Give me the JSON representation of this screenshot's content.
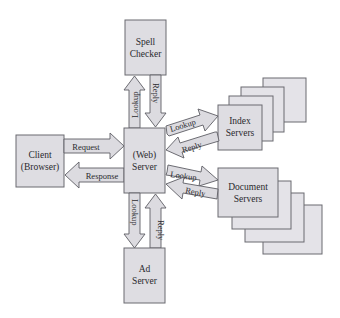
{
  "diagram": {
    "type": "web-search-architecture",
    "nodes": {
      "client": {
        "line1": "Client",
        "line2": "(Browser)"
      },
      "web_server": {
        "line1": "(Web)",
        "line2": "Server"
      },
      "spell_checker": {
        "line1": "Spell",
        "line2": "Checker"
      },
      "ad_server": {
        "line1": "Ad",
        "line2": "Server"
      },
      "index_servers": {
        "line1": "Index",
        "line2": "Servers"
      },
      "document_servers": {
        "line1": "Document",
        "line2": "Servers"
      }
    },
    "edges": {
      "request": "Request",
      "response": "Response",
      "spell_lookup": "Lookup",
      "spell_reply": "Reply",
      "ad_lookup": "Lookup",
      "ad_reply": "Reply",
      "index_lookup": "Lookup",
      "index_reply": "Reply",
      "doc_lookup": "Lookup",
      "doc_reply": "Reply"
    },
    "colors": {
      "box_fill": "#dedde2",
      "stroke": "#6a6a70",
      "background": "#ffffff"
    }
  }
}
